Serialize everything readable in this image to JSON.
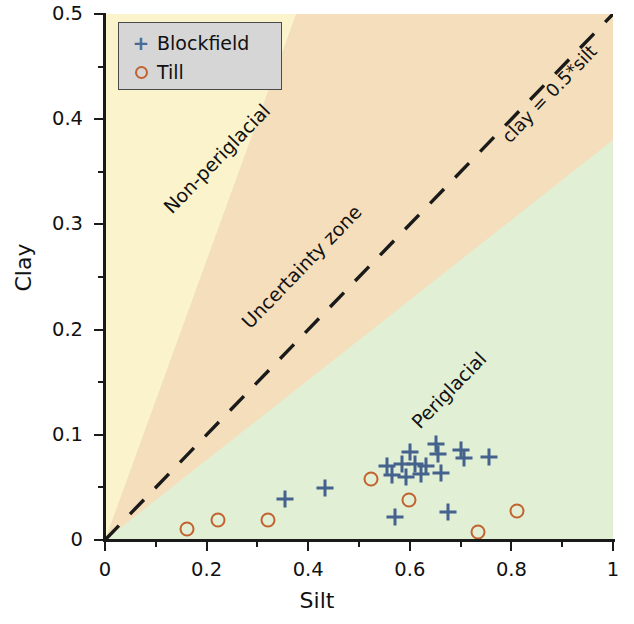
{
  "chart_data": {
    "type": "scatter",
    "title": "",
    "xlabel": "Silt",
    "ylabel": "Clay",
    "xlim": [
      0,
      1
    ],
    "ylim": [
      0,
      0.5
    ],
    "grid": false,
    "xticks": [
      "0",
      "0.2",
      "0.4",
      "0.6",
      "0.8",
      "1"
    ],
    "xtick_values": [
      0,
      0.2,
      0.4,
      0.6,
      0.8,
      1
    ],
    "xminor_values": [
      0.1,
      0.3,
      0.5,
      0.7,
      0.9
    ],
    "yticks": [
      "0",
      "0.1",
      "0.2",
      "0.3",
      "0.4",
      "0.5"
    ],
    "ytick_values": [
      0,
      0.1,
      0.2,
      0.3,
      0.4,
      0.5
    ],
    "yminor_values": [
      0.05,
      0.15,
      0.25,
      0.35,
      0.45
    ],
    "legend_position": "upper-left",
    "series": [
      {
        "name": "Blockfield",
        "marker": "plus",
        "color": "#44628d",
        "points": [
          [
            0.354,
            0.039
          ],
          [
            0.434,
            0.049
          ],
          [
            0.556,
            0.07
          ],
          [
            0.565,
            0.062
          ],
          [
            0.57,
            0.022
          ],
          [
            0.585,
            0.072
          ],
          [
            0.592,
            0.06
          ],
          [
            0.6,
            0.084
          ],
          [
            0.611,
            0.072
          ],
          [
            0.622,
            0.063
          ],
          [
            0.632,
            0.07
          ],
          [
            0.652,
            0.091
          ],
          [
            0.656,
            0.082
          ],
          [
            0.661,
            0.064
          ],
          [
            0.676,
            0.027
          ],
          [
            0.7,
            0.086
          ],
          [
            0.706,
            0.078
          ],
          [
            0.756,
            0.079
          ]
        ]
      },
      {
        "name": "Till",
        "marker": "circle",
        "color": "#c1622f",
        "points": [
          [
            0.162,
            0.01
          ],
          [
            0.222,
            0.019
          ],
          [
            0.32,
            0.019
          ],
          [
            0.524,
            0.058
          ],
          [
            0.598,
            0.038
          ],
          [
            0.735,
            0.008
          ],
          [
            0.812,
            0.028
          ]
        ]
      }
    ],
    "reference_line": {
      "label": "clay = 0.5*silt",
      "slope": 0.5,
      "intercept": 0,
      "style": "dashed",
      "color": "#1a1a1a"
    },
    "regions": [
      {
        "name": "Non-periglacial",
        "label": "Non-periglacial",
        "color": "#fbf3cb",
        "description": "upper-left region above the uncertainty band"
      },
      {
        "name": "Uncertainty zone",
        "label": "Uncertainty zone",
        "color": "#f4debb",
        "description": "diagonal band centred on clay = 0.5*silt"
      },
      {
        "name": "Periglacial",
        "label": "Periglacial",
        "color": "#e1efd4",
        "description": "lower-right region below the uncertainty band"
      }
    ]
  },
  "legend": {
    "items": [
      {
        "marker": "plus-marker",
        "label": "Blockfield"
      },
      {
        "marker": "circle-marker",
        "label": "Till"
      }
    ]
  },
  "axes": {
    "x_title": "Silt",
    "y_title": "Clay"
  },
  "annotations": {
    "non_periglacial": "Non-periglacial",
    "uncertainty_zone": "Uncertainty zone",
    "periglacial": "Periglacial",
    "reference_line": "clay = 0.5*silt"
  }
}
